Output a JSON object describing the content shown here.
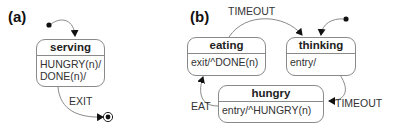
{
  "panels": {
    "a": {
      "label": "(a)",
      "states": {
        "serving": {
          "name": "serving",
          "actions": [
            "HUNGRY(n)/",
            "DONE(n)/"
          ]
        }
      },
      "transitions": {
        "exit": {
          "label": "EXIT",
          "from": "serving",
          "to": "final"
        }
      }
    },
    "b": {
      "label": "(b)",
      "states": {
        "eating": {
          "name": "eating",
          "actions": [
            "exit/^DONE(n)"
          ]
        },
        "thinking": {
          "name": "thinking",
          "actions": [
            "entry/"
          ]
        },
        "hungry": {
          "name": "hungry",
          "actions": [
            "entry/^HUNGRY(n)"
          ]
        }
      },
      "transitions": {
        "eating_to_thinking": {
          "label": "TIMEOUT",
          "from": "eating",
          "to": "thinking"
        },
        "thinking_to_hungry": {
          "label": "TIMEOUT",
          "from": "thinking",
          "to": "hungry"
        },
        "hungry_to_eating": {
          "label": "EAT",
          "from": "hungry",
          "to": "eating"
        }
      }
    }
  },
  "colors": {
    "stroke": "#8a8a8a",
    "text": "#222222",
    "marker": "#111111"
  }
}
